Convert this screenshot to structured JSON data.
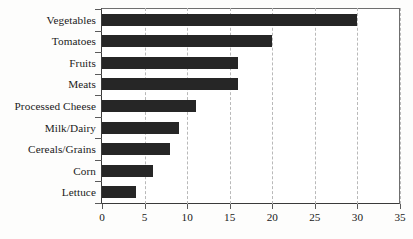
{
  "chart_data": {
    "type": "bar",
    "orientation": "horizontal",
    "title": "",
    "subtitle": "",
    "xlabel": "",
    "ylabel": "",
    "categories": [
      "Vegetables",
      "Tomatoes",
      "Fruits",
      "Meats",
      "Processed Cheese",
      "Milk/Dairy",
      "Cereals/Grains",
      "Corn",
      "Lettuce"
    ],
    "values": [
      30,
      20,
      16,
      16,
      11,
      9,
      8,
      6,
      4
    ],
    "xlim": [
      0,
      35
    ],
    "xticks": [
      0,
      5,
      10,
      15,
      20,
      25,
      30,
      35
    ],
    "xtick_labels": [
      "0",
      "5",
      "10",
      "15",
      "20",
      "25",
      "30",
      "35"
    ],
    "grid": {
      "vertical": true,
      "horizontal": false,
      "style": "dashed",
      "color": "#b9b9b9"
    },
    "legend": {
      "visible": false,
      "position": "none",
      "entries": []
    },
    "annotations": [],
    "colors": {
      "bar": "#262626",
      "background": "#ffffff",
      "axis": "#3a3a3a",
      "frame": "#6f6f6f",
      "text": "#1a1a1a"
    }
  }
}
